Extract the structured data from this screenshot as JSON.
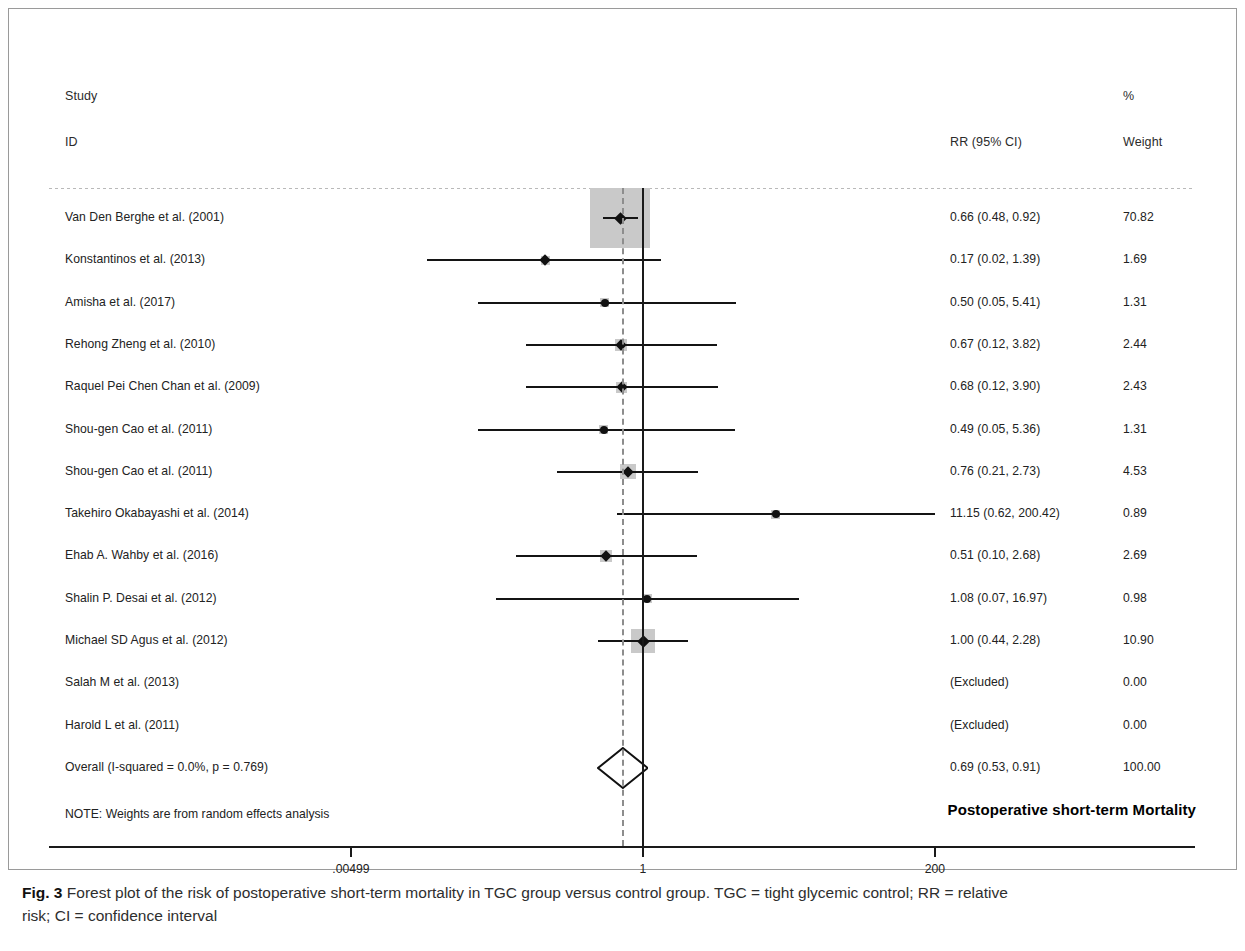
{
  "figure": {
    "caption_label": "Fig. 3",
    "caption_text": " Forest plot of the risk of postoperative short-term mortality in TGC group versus control group. TGC = tight glycemic control; RR = relative",
    "caption_text_line2": "risk; CI = confidence interval"
  },
  "header": {
    "col_study": "Study",
    "col_id": "ID",
    "col_percent": "%",
    "col_effect": "RR (95% CI)",
    "col_weight": "Weight"
  },
  "footer": {
    "note": "NOTE: Weights are from random effects analysis",
    "plot_title": "Postoperative short-term Mortality"
  },
  "axis": {
    "tick_labels": [
      ".00499",
      "1",
      "200"
    ],
    "tick_values": [
      0.00499,
      1,
      200
    ],
    "null_value": 1,
    "pooled_value": 0.69
  },
  "chart_data": {
    "type": "forest",
    "title": "Postoperative short-term Mortality",
    "xlabel": "",
    "ylabel": "",
    "scale": "log",
    "xlim": [
      0.00499,
      200
    ],
    "xticks": [
      0.00499,
      1,
      200
    ],
    "xtick_labels": [
      ".00499",
      "1",
      "200"
    ],
    "effect_measure": "RR (95% CI)",
    "null_line": 1,
    "pooled_line": 0.69,
    "heterogeneity": "I-squared = 0.0%, p = 0.769",
    "studies": [
      {
        "id": "Van Den Berghe et al. (2001)",
        "effect_text": "0.66 (0.48, 0.92)",
        "est": 0.66,
        "lo": 0.48,
        "hi": 0.92,
        "weight_text": "70.82",
        "weight": 70.82,
        "excluded": false
      },
      {
        "id": "Konstantinos et al. (2013)",
        "effect_text": "0.17 (0.02, 1.39)",
        "est": 0.17,
        "lo": 0.02,
        "hi": 1.39,
        "weight_text": "1.69",
        "weight": 1.69,
        "excluded": false
      },
      {
        "id": "Amisha et al. (2017)",
        "effect_text": "0.50 (0.05, 5.41)",
        "est": 0.5,
        "lo": 0.05,
        "hi": 5.41,
        "weight_text": "1.31",
        "weight": 1.31,
        "excluded": false
      },
      {
        "id": "Rehong Zheng et al. (2010)",
        "effect_text": "0.67 (0.12, 3.82)",
        "est": 0.67,
        "lo": 0.12,
        "hi": 3.82,
        "weight_text": "2.44",
        "weight": 2.44,
        "excluded": false
      },
      {
        "id": "Raquel Pei Chen Chan et al. (2009)",
        "effect_text": "0.68 (0.12, 3.90)",
        "est": 0.68,
        "lo": 0.12,
        "hi": 3.9,
        "weight_text": "2.43",
        "weight": 2.43,
        "excluded": false
      },
      {
        "id": "Shou-gen Cao et al. (2011)",
        "effect_text": "0.49 (0.05, 5.36)",
        "est": 0.49,
        "lo": 0.05,
        "hi": 5.36,
        "weight_text": "1.31",
        "weight": 1.31,
        "excluded": false
      },
      {
        "id": "Shou-gen Cao et al. (2011)",
        "effect_text": "0.76 (0.21, 2.73)",
        "est": 0.76,
        "lo": 0.21,
        "hi": 2.73,
        "weight_text": "4.53",
        "weight": 4.53,
        "excluded": false
      },
      {
        "id": "Takehiro Okabayashi et al. (2014)",
        "effect_text": "11.15 (0.62, 200.42)",
        "est": 11.15,
        "lo": 0.62,
        "hi": 200.42,
        "weight_text": "0.89",
        "weight": 0.89,
        "excluded": false
      },
      {
        "id": "Ehab A. Wahby et al. (2016)",
        "effect_text": "0.51 (0.10, 2.68)",
        "est": 0.51,
        "lo": 0.1,
        "hi": 2.68,
        "weight_text": "2.69",
        "weight": 2.69,
        "excluded": false
      },
      {
        "id": "Shalin P. Desai et al. (2012)",
        "effect_text": "1.08 (0.07, 16.97)",
        "est": 1.08,
        "lo": 0.07,
        "hi": 16.97,
        "weight_text": "0.98",
        "weight": 0.98,
        "excluded": false
      },
      {
        "id": "Michael SD Agus et al. (2012)",
        "effect_text": "1.00 (0.44, 2.28)",
        "est": 1.0,
        "lo": 0.44,
        "hi": 2.28,
        "weight_text": "10.90",
        "weight": 10.9,
        "excluded": false
      },
      {
        "id": "Salah M et al. (2013)",
        "effect_text": "(Excluded)",
        "est": null,
        "lo": null,
        "hi": null,
        "weight_text": "0.00",
        "weight": 0.0,
        "excluded": true
      },
      {
        "id": "Harold L et al. (2011)",
        "effect_text": "(Excluded)",
        "est": null,
        "lo": null,
        "hi": null,
        "weight_text": "0.00",
        "weight": 0.0,
        "excluded": true
      }
    ],
    "overall": {
      "id": "Overall  (I-squared = 0.0%, p = 0.769)",
      "effect_text": "0.69 (0.53, 0.91)",
      "est": 0.69,
      "lo": 0.53,
      "hi": 0.91,
      "weight_text": "100.00",
      "weight": 100.0
    }
  }
}
